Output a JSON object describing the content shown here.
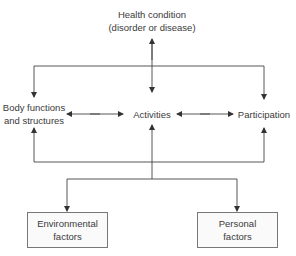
{
  "diagram": {
    "nodes": {
      "health_condition": {
        "line1": "Health condition",
        "line2": "(disorder or disease)"
      },
      "body_functions": {
        "line1": "Body functions",
        "line2": "and structures"
      },
      "activities": {
        "label": "Activities"
      },
      "participation": {
        "label": "Participation"
      },
      "environmental": {
        "line1": "Environmental",
        "line2": "factors"
      },
      "personal": {
        "line1": "Personal",
        "line2": "factors"
      }
    },
    "edges": [
      {
        "from": "health_condition",
        "to": "activities",
        "type": "bidirectional"
      },
      {
        "from": "health_condition",
        "to": "body_functions",
        "type": "directed"
      },
      {
        "from": "health_condition",
        "to": "participation",
        "type": "directed"
      },
      {
        "from": "body_functions",
        "to": "activities",
        "type": "bidirectional"
      },
      {
        "from": "activities",
        "to": "participation",
        "type": "bidirectional"
      },
      {
        "from": "contextual_factors",
        "to": "body_functions",
        "type": "directed"
      },
      {
        "from": "contextual_factors",
        "to": "activities",
        "type": "directed"
      },
      {
        "from": "contextual_factors",
        "to": "participation",
        "type": "directed"
      },
      {
        "from": "activities",
        "to": "environmental",
        "type": "directed"
      },
      {
        "from": "activities",
        "to": "personal",
        "type": "directed"
      }
    ],
    "colors": {
      "line": "#444444",
      "text": "#3a3a3a",
      "box_border": "#777777",
      "box_fill": "#fafafa"
    }
  }
}
